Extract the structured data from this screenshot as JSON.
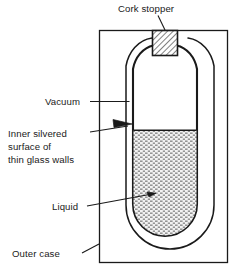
{
  "diagram": {
    "background_color": "#ffffff",
    "stroke_color": "#1a1a1a",
    "labels": {
      "cork_stopper": "Cork stopper",
      "vacuum": "Vacuum",
      "inner_silvered_line1": "Inner silvered",
      "inner_silvered_line2": "surface of",
      "inner_silvered_line3": "thin glass walls",
      "liquid": "Liquid",
      "outer_case": "Outer case"
    },
    "parts": {
      "cork_stopper": {
        "name": "cork-stopper",
        "fill": "#ffffff",
        "hatch": "diagonal"
      },
      "outer_case": {
        "name": "outer-case",
        "fill": "#ffffff"
      },
      "vacuum_gap": {
        "name": "vacuum-gap",
        "fill": "#ffffff"
      },
      "glass_walls": {
        "name": "thin-glass-walls",
        "fill": "#ffffff"
      },
      "liquid": {
        "name": "liquid",
        "fill": "#e8e8e8",
        "texture": "stipple"
      }
    }
  }
}
